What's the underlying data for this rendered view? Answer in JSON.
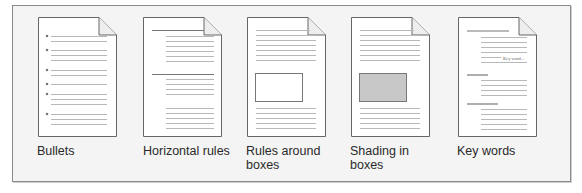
{
  "figure": {
    "panels": [
      {
        "id": "bullets",
        "label": "Bullets",
        "label_lines": [
          "Bullets"
        ]
      },
      {
        "id": "horizontal-rules",
        "label": "Horizontal rules",
        "label_lines": [
          "Horizontal rules"
        ]
      },
      {
        "id": "rules-around-boxes",
        "label": "Rules around boxes",
        "label_lines": [
          "Rules around",
          "boxes"
        ]
      },
      {
        "id": "shading-in-boxes",
        "label": "Shading in boxes",
        "label_lines": [
          "Shading in",
          "boxes"
        ]
      },
      {
        "id": "key-words",
        "label": "Key words",
        "label_lines": [
          "Key words"
        ],
        "inline_text": "Key word..."
      }
    ],
    "colors": {
      "frame_bg": "#f4f4f4",
      "frame_border": "#8a8a8a",
      "page_bg": "#ffffff",
      "page_border": "#666666",
      "text_line": "#b8b8b8",
      "rule": "#777777",
      "shaded_box": "#c8c8c8"
    }
  }
}
